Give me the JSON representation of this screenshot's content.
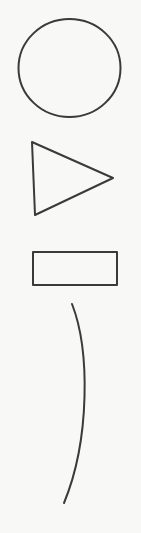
{
  "diagram": {
    "style": "hand-drawn sketch on paper",
    "background_color": "#f8f8f6",
    "stroke_color": "#3a3a3a",
    "shapes": [
      {
        "type": "circle",
        "label": "",
        "cx": 69.5,
        "cy": 68,
        "rx": 51,
        "ry": 49
      },
      {
        "type": "triangle",
        "label": "",
        "points": "32,142 113,178 35,215"
      },
      {
        "type": "rectangle",
        "label": "",
        "x": 33,
        "y": 252,
        "width": 84,
        "height": 33
      },
      {
        "type": "arc",
        "label": "",
        "path": "M72,304 C90,350 90,440 64,503"
      }
    ]
  }
}
